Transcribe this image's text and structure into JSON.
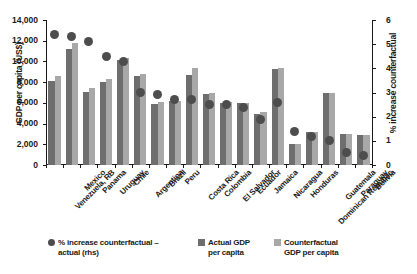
{
  "chart_data": {
    "type": "bar",
    "title": "",
    "xlabel": "",
    "ylabel": "GDP per capita (US$)",
    "y2label": "% increase counterfactual",
    "ylim": [
      0,
      14000
    ],
    "y2lim": [
      0,
      6
    ],
    "grid": false,
    "legend_position": "bottom",
    "categories": [
      "Venezuela, RB",
      "Mexico",
      "Panama",
      "Uruguay",
      "Chile",
      "Argentina",
      "Brazil",
      "Peru",
      "Costa Rica",
      "Colombia",
      "El Salvador",
      "Ecuador",
      "Jamaica",
      "Nicaragua",
      "Honduras",
      "Dominican Republic",
      "Guatemala",
      "Paraguay",
      "Bolivia"
    ],
    "series": [
      {
        "name": "Actual GDP per capita",
        "axis": "left",
        "color": "#6e6e6e",
        "values": [
          8150,
          11200,
          7050,
          8000,
          10100,
          8550,
          5900,
          6150,
          8650,
          6900,
          6000,
          5950,
          4950,
          9250,
          2050,
          3150,
          7000,
          3000,
          2900
        ]
      },
      {
        "name": "Counterfactual GDP per capita",
        "axis": "left",
        "color": "#a8a8a8",
        "values": [
          8550,
          11800,
          7450,
          8300,
          10300,
          8800,
          6100,
          6200,
          9350,
          6950,
          6050,
          6000,
          5100,
          9400,
          2050,
          3150,
          7000,
          3000,
          2900
        ]
      },
      {
        "name": "% increase counterfactual – actual (rhs)",
        "axis": "right",
        "type": "scatter",
        "color": "#4d4d4d",
        "values": [
          5.4,
          5.3,
          5.1,
          4.5,
          4.3,
          3.0,
          2.9,
          2.7,
          2.7,
          2.5,
          2.5,
          2.4,
          1.9,
          2.6,
          1.4,
          1.2,
          1.0,
          0.5,
          0.4
        ]
      }
    ],
    "y_ticks": [
      "0",
      "2,000",
      "4,000",
      "6,000",
      "8,000",
      "10,000",
      "12,000",
      "14,000"
    ],
    "y2_ticks": [
      "0",
      "1",
      "2",
      "3",
      "4",
      "5",
      "6"
    ]
  },
  "legend": {
    "items": [
      {
        "marker": "dot",
        "line1": "% increase counterfactual –",
        "line2": "actual (rhs)"
      },
      {
        "marker": "swatch-dark",
        "line1": "Actual GDP",
        "line2": "per capita"
      },
      {
        "marker": "swatch-light",
        "line1": "Counterfactual",
        "line2": "GDP per capita"
      }
    ]
  }
}
